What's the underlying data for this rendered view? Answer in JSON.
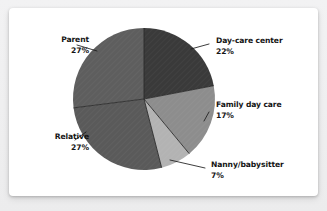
{
  "card": {
    "background_color": "#ffffff",
    "page_background_color": "#efeff0"
  },
  "chart_data": {
    "type": "pie",
    "title": "",
    "subtitle": "",
    "xlabel": "",
    "ylabel": "",
    "legend_position": "none",
    "grid": false,
    "unit": "%",
    "start_angle_deg": 0,
    "direction": "clockwise",
    "total": 100,
    "categories": [
      "Day-care center",
      "Family day care",
      "Nanny/babysitter",
      "Relative",
      "Parent"
    ],
    "values": [
      22,
      17,
      7,
      27,
      27
    ],
    "slices": [
      {
        "label": "Day-care center",
        "value": 22,
        "value_text": "22%",
        "color": "#3a3a3a",
        "label_position": "right",
        "leader_line": true
      },
      {
        "label": "Family day care",
        "value": 17,
        "value_text": "17%",
        "color": "#8d8d8d",
        "label_position": "right",
        "leader_line": true
      },
      {
        "label": "Nanny/babysitter",
        "value": 7,
        "value_text": "7%",
        "color": "#b3b3b3",
        "label_position": "right",
        "leader_line": true
      },
      {
        "label": "Relative",
        "value": 27,
        "value_text": "27%",
        "color": "#5a5a5a",
        "label_position": "left",
        "leader_line": true
      },
      {
        "label": "Parent",
        "value": 27,
        "value_text": "27%",
        "color": "#5e5e5e",
        "label_position": "left",
        "leader_line": true
      }
    ]
  },
  "labels": {
    "daycare": {
      "name": "Day-care center",
      "value": "22%"
    },
    "family": {
      "name": "Family day care",
      "value": "17%"
    },
    "nanny": {
      "name": "Nanny/babysitter",
      "value": "7%"
    },
    "parent": {
      "name": "Parent",
      "value": "27%"
    },
    "relative": {
      "name": "Relative",
      "value": "27%"
    }
  }
}
